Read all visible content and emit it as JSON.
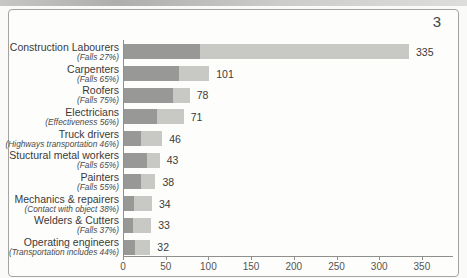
{
  "page": {
    "number": "3"
  },
  "chart_data": {
    "type": "bar",
    "orientation": "horizontal",
    "title": "",
    "xlabel": "",
    "ylabel": "",
    "xlim": [
      0,
      350
    ],
    "x_ticks": [
      "0",
      "50",
      "100",
      "150",
      "200",
      "250",
      "300",
      "350"
    ],
    "grid": false,
    "legend": null,
    "note": "each bar split into darker segment (share given in sublabel percentage) and lighter remainder",
    "colors": {
      "primary_segment": "#989896",
      "secondary_segment": "#c8c8c5",
      "axis": "#8f8f8d",
      "text": "#3a3a3a"
    },
    "bars": [
      {
        "label": "Construction Labourers",
        "sublabel": "(Falls 27%)",
        "value": 335,
        "segment_pct": 27
      },
      {
        "label": "Carpenters",
        "sublabel": "(Falls 65%)",
        "value": 101,
        "segment_pct": 65
      },
      {
        "label": "Roofers",
        "sublabel": "(Falls 75%)",
        "value": 78,
        "segment_pct": 75
      },
      {
        "label": "Electricians",
        "sublabel": "(Effectiveness 56%)",
        "value": 71,
        "segment_pct": 56
      },
      {
        "label": "Truck drivers",
        "sublabel": "(Highways transportation 46%)",
        "value": 46,
        "segment_pct": 46
      },
      {
        "label": "Stuctural metal workers",
        "sublabel": "(Falls 65%)",
        "value": 43,
        "segment_pct": 65
      },
      {
        "label": "Painters",
        "sublabel": "(Falls 55%)",
        "value": 38,
        "segment_pct": 55
      },
      {
        "label": "Mechanics & repairers",
        "sublabel": "(Contact with object 38%)",
        "value": 34,
        "segment_pct": 38
      },
      {
        "label": "Welders & Cutters",
        "sublabel": "(Falls 37%)",
        "value": 33,
        "segment_pct": 37
      },
      {
        "label": "Operating engineers",
        "sublabel": "(Transportation includes 44%)",
        "value": 32,
        "segment_pct": 44
      }
    ]
  }
}
